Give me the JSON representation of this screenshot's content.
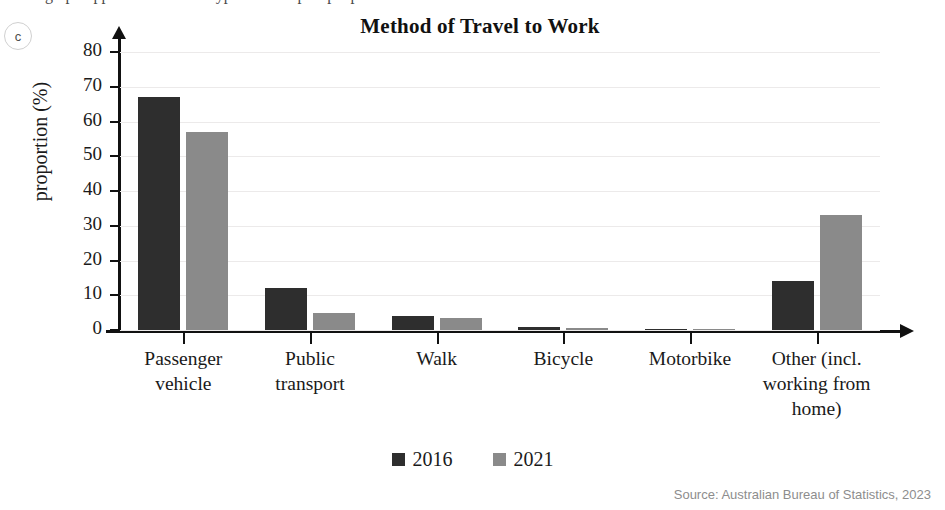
{
  "part_marker": "c",
  "top_clipped_text": "a graph opposite shows the types of transport people used to travel",
  "chart_data": {
    "type": "bar",
    "title": "Method of Travel to Work",
    "xlabel": "",
    "ylabel": "proportion (%)",
    "ylim": [
      0,
      80
    ],
    "ytick_values": [
      0,
      10,
      20,
      30,
      40,
      50,
      60,
      70,
      80
    ],
    "ytick_labels": [
      "0",
      "10",
      "20",
      "30",
      "40",
      "50",
      "60",
      "70",
      "80"
    ],
    "grid": true,
    "legend_position": "bottom-center",
    "categories": [
      "Passenger vehicle",
      "Public transport",
      "Walk",
      "Bicycle",
      "Motorbike",
      "Other (incl. working from home)"
    ],
    "category_label_lines": [
      [
        "Passenger",
        "vehicle"
      ],
      [
        "Public",
        "transport"
      ],
      [
        "Walk"
      ],
      [
        "Bicycle"
      ],
      [
        "Motorbike"
      ],
      [
        "Other (incl.",
        "working from",
        "home)"
      ]
    ],
    "series": [
      {
        "name": "2016",
        "color": "#2e2e2e",
        "values": [
          67,
          12,
          4,
          1,
          0.3,
          14
        ]
      },
      {
        "name": "2021",
        "color": "#8a8a8a",
        "values": [
          57,
          5,
          3.5,
          0.7,
          0.3,
          33
        ]
      }
    ],
    "source": "Source: Australian Bureau of Statistics, 2023"
  }
}
